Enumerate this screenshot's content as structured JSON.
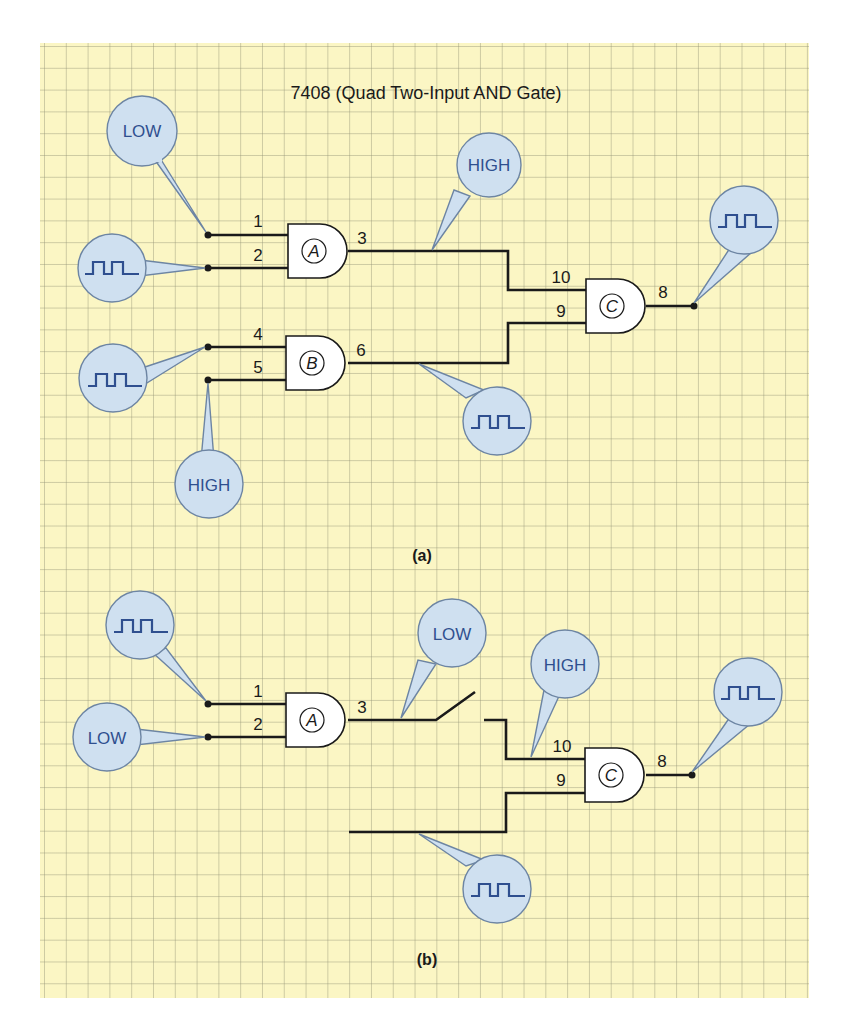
{
  "title": "7408 (Quad Two-Input AND Gate)",
  "colors": {
    "paper": "#fbf6c4",
    "grid": "#b4b490",
    "probe_fill": "#cfe0f0",
    "probe_stroke": "#6d85a3",
    "probe_text": "#2f4f8f",
    "wire": "#1a1a1a"
  },
  "diagram_a": {
    "caption": "(a)",
    "gates": [
      {
        "label": "A",
        "pins": {
          "in1": "1",
          "in2": "2",
          "out": "3"
        }
      },
      {
        "label": "B",
        "pins": {
          "in1": "4",
          "in2": "5",
          "out": "6"
        }
      },
      {
        "label": "C",
        "pins": {
          "in1": "10",
          "in2": "9",
          "out": "8"
        }
      }
    ],
    "probes": [
      {
        "target": "pin 1",
        "reading": "LOW"
      },
      {
        "target": "pin 2",
        "reading": "pulse"
      },
      {
        "target": "pin 3",
        "reading": "HIGH"
      },
      {
        "target": "pin 4",
        "reading": "pulse"
      },
      {
        "target": "pin 5",
        "reading": "HIGH"
      },
      {
        "target": "pin 6",
        "reading": "pulse"
      },
      {
        "target": "pin 8",
        "reading": "pulse"
      }
    ]
  },
  "diagram_b": {
    "caption": "(b)",
    "gates": [
      {
        "label": "A",
        "pins": {
          "in1": "1",
          "in2": "2",
          "out": "3"
        }
      },
      {
        "label": "C",
        "pins": {
          "in1": "10",
          "in2": "9",
          "out": "8"
        }
      }
    ],
    "probes": [
      {
        "target": "pin 1",
        "reading": "pulse"
      },
      {
        "target": "pin 2",
        "reading": "LOW"
      },
      {
        "target": "pin 3",
        "reading": "LOW"
      },
      {
        "target": "pin 10",
        "reading": "HIGH"
      },
      {
        "target": "pin 9",
        "reading": "pulse"
      },
      {
        "target": "pin 8",
        "reading": "pulse"
      }
    ]
  }
}
